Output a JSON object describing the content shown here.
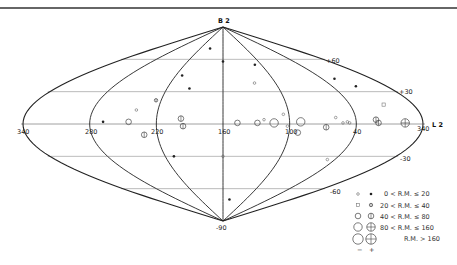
{
  "chart_data": {
    "type": "scatter",
    "title": "",
    "projection": "sinusoidal",
    "pole_labels": {
      "north": "B 2",
      "south": "-90"
    },
    "equator_label": "L 2",
    "center_longitude": 160,
    "longitude_ticks": [
      "340",
      "280",
      "220",
      "160",
      "100",
      "40",
      "340"
    ],
    "latitude_ticks": [
      {
        "lat": 60,
        "label": "+60"
      },
      {
        "lat": 30,
        "label": "+30"
      },
      {
        "lat": -30,
        "label": "-30"
      },
      {
        "lat": -60,
        "label": "-60"
      }
    ],
    "meridians_deg_offset": [
      -180,
      -120,
      -60,
      0,
      60,
      120,
      180
    ],
    "legend": {
      "rows": [
        {
          "size_class": 1,
          "range": "0  <  R.M.  ≤   20"
        },
        {
          "size_class": 2,
          "range": "20  <  R.M.  ≤   40"
        },
        {
          "size_class": 3,
          "range": "40  <  R.M.  ≤   80"
        },
        {
          "size_class": 4,
          "range": "80  <  R.M.  ≤  160"
        },
        {
          "size_class": 5,
          "range": "R.M.  >  160"
        }
      ],
      "sign_labels": {
        "negative": "−",
        "positive": "+"
      }
    },
    "points": [
      {
        "l": 194,
        "b": 70,
        "sign": "+",
        "size": 1
      },
      {
        "l": 160,
        "b": 58,
        "sign": "+",
        "size": 1
      },
      {
        "l": 212,
        "b": 45,
        "sign": "+",
        "size": 1
      },
      {
        "l": 196,
        "b": 33,
        "sign": "+",
        "size": 1
      },
      {
        "l": 225,
        "b": 22,
        "sign": "+",
        "size": 2
      },
      {
        "l": 240,
        "b": 13,
        "sign": "-",
        "size": 1
      },
      {
        "l": 268,
        "b": 2,
        "sign": "+",
        "size": 1
      },
      {
        "l": 245,
        "b": 2,
        "sign": "-",
        "size": 3
      },
      {
        "l": 198,
        "b": 5,
        "sign": "+",
        "size": 3
      },
      {
        "l": 196,
        "b": -2,
        "sign": "+",
        "size": 3
      },
      {
        "l": 232,
        "b": -10,
        "sign": "+",
        "size": 3
      },
      {
        "l": 211,
        "b": -30,
        "sign": "+",
        "size": 1
      },
      {
        "l": 160,
        "b": -30,
        "sign": "-",
        "size": 1
      },
      {
        "l": 143,
        "b": -70,
        "sign": "+",
        "size": 1
      },
      {
        "l": 110,
        "b": 55,
        "sign": "+",
        "size": 1
      },
      {
        "l": 124,
        "b": 38,
        "sign": "-",
        "size": 1
      },
      {
        "l": 147,
        "b": 1,
        "sign": "-",
        "size": 3
      },
      {
        "l": 129,
        "b": 1,
        "sign": "-",
        "size": 3
      },
      {
        "l": 123,
        "b": 4,
        "sign": "-",
        "size": 1
      },
      {
        "l": 114,
        "b": 1,
        "sign": "-",
        "size": 4
      },
      {
        "l": 105,
        "b": 9,
        "sign": "-",
        "size": 1
      },
      {
        "l": 90,
        "b": 2,
        "sign": "-",
        "size": 4
      },
      {
        "l": 102,
        "b": -2,
        "sign": "-",
        "size": 1
      },
      {
        "l": 92,
        "b": -8,
        "sign": "-",
        "size": 3
      },
      {
        "l": 67,
        "b": -3,
        "sign": "+",
        "size": 3
      },
      {
        "l": 58,
        "b": 6,
        "sign": "-",
        "size": 1
      },
      {
        "l": 52,
        "b": 1,
        "sign": "-",
        "size": 1
      },
      {
        "l": 48,
        "b": 2,
        "sign": "-",
        "size": 1
      },
      {
        "l": 46,
        "b": 1,
        "sign": "-",
        "size": 1
      },
      {
        "l": 48,
        "b": -33,
        "sign": "-",
        "size": 1
      },
      {
        "l": 25,
        "b": 42,
        "sign": "+",
        "size": 1
      },
      {
        "l": 14,
        "b": 35,
        "sign": "+",
        "size": 1
      },
      {
        "l": 8,
        "b": 18,
        "sign": "-",
        "size": 2
      },
      {
        "l": 22,
        "b": 4,
        "sign": "+",
        "size": 3
      },
      {
        "l": 20,
        "b": 1,
        "sign": "+",
        "size": 3
      },
      {
        "l": 356,
        "b": 1,
        "sign": "+",
        "size": 4
      }
    ]
  }
}
